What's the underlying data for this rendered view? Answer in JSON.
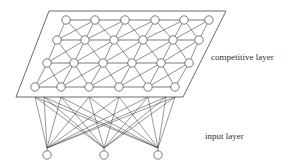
{
  "diagram": {
    "type": "self-organizing-map",
    "labels": {
      "competitive_layer": "competitive layer",
      "input_layer": "input layer"
    },
    "plane": {
      "corners": [
        [
          49,
          11
        ],
        [
          226,
          11
        ],
        [
          183,
          97
        ],
        [
          16,
          97
        ]
      ]
    },
    "competitive_nodes": [
      [
        [
          66,
          20
        ],
        [
          95,
          20
        ],
        [
          125,
          20
        ],
        [
          155,
          20
        ],
        [
          184,
          20
        ],
        [
          209,
          20
        ]
      ],
      [
        [
          57,
          40
        ],
        [
          85,
          40
        ],
        [
          114,
          40
        ],
        [
          143,
          40
        ],
        [
          173,
          40
        ],
        [
          199,
          40
        ]
      ],
      [
        [
          47,
          63
        ],
        [
          74,
          63
        ],
        [
          103,
          63
        ],
        [
          132,
          63
        ],
        [
          161,
          63
        ],
        [
          189,
          63
        ]
      ],
      [
        [
          35,
          87
        ],
        [
          61,
          87
        ],
        [
          89,
          87
        ],
        [
          119,
          87
        ],
        [
          148,
          87
        ],
        [
          175,
          87
        ]
      ]
    ],
    "input_nodes": [
      [
        47,
        155
      ],
      [
        104,
        155
      ],
      [
        158,
        155
      ]
    ],
    "input_fan_points": [
      [
        47,
        148
      ],
      [
        104,
        148
      ],
      [
        158,
        148
      ]
    ],
    "fan_top_points": [
      [
        35,
        97
      ],
      [
        44,
        97
      ],
      [
        61,
        97
      ],
      [
        89,
        97
      ],
      [
        119,
        97
      ],
      [
        148,
        97
      ],
      [
        175,
        97
      ],
      [
        166,
        97
      ]
    ],
    "node_radius": 4.2,
    "colors": {
      "stroke": "#444444",
      "node_fill": "#ffffff",
      "plane_fill": "#ffffff"
    }
  }
}
